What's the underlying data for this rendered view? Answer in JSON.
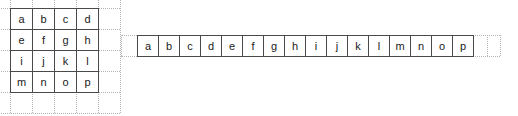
{
  "figure": {
    "colors": {
      "cell_border": "#4a4a4a",
      "guide_line": "#b4b4b4",
      "text": "#1a1a1a",
      "background": "#ffffff"
    }
  },
  "matrix": {
    "rows": 4,
    "cols": 4,
    "cell_width": 22,
    "cell_height": 21,
    "origin_x": 10,
    "origin_y": 8,
    "values": [
      [
        "a",
        "b",
        "c",
        "d"
      ],
      [
        "e",
        "f",
        "g",
        "h"
      ],
      [
        "i",
        "j",
        "k",
        "l"
      ],
      [
        "m",
        "n",
        "o",
        "p"
      ]
    ],
    "guides": {
      "extra_cols": 1,
      "extra_rows": 1,
      "lead_col": 1,
      "lead_row": 1
    }
  },
  "array": {
    "length": 16,
    "cell_width": 21,
    "cell_height": 21,
    "origin_x": 19,
    "origin_y": 35,
    "values": [
      "a",
      "b",
      "c",
      "d",
      "e",
      "f",
      "g",
      "h",
      "i",
      "j",
      "k",
      "l",
      "m",
      "n",
      "o",
      "p"
    ],
    "guides": {
      "lead_len": 16,
      "trail_len": 27
    }
  }
}
